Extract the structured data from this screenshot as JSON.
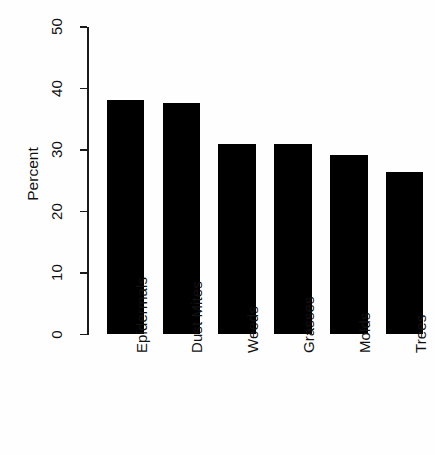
{
  "chart_data": {
    "type": "bar",
    "title": "",
    "xlabel": "",
    "ylabel": "Percent",
    "categories": [
      "Epidermals",
      "Dust Mites",
      "Weeds",
      "Grasses",
      "Molds",
      "Trees"
    ],
    "values": [
      38.2,
      37.7,
      31.0,
      31.0,
      29.2,
      26.5
    ],
    "ylim": [
      0,
      50
    ],
    "yticks": [
      0,
      10,
      20,
      30,
      40,
      50
    ],
    "ytick_labels": [
      "0",
      "10",
      "20",
      "30",
      "40",
      "50"
    ],
    "grid": false,
    "legend": false,
    "bar_color": "#000000",
    "axis_color": "#1a1a1a",
    "background_color": "#fefefe",
    "orientation": "vertical",
    "label_rotation_degrees": 90
  },
  "axis": {
    "y_title": "Percent"
  }
}
